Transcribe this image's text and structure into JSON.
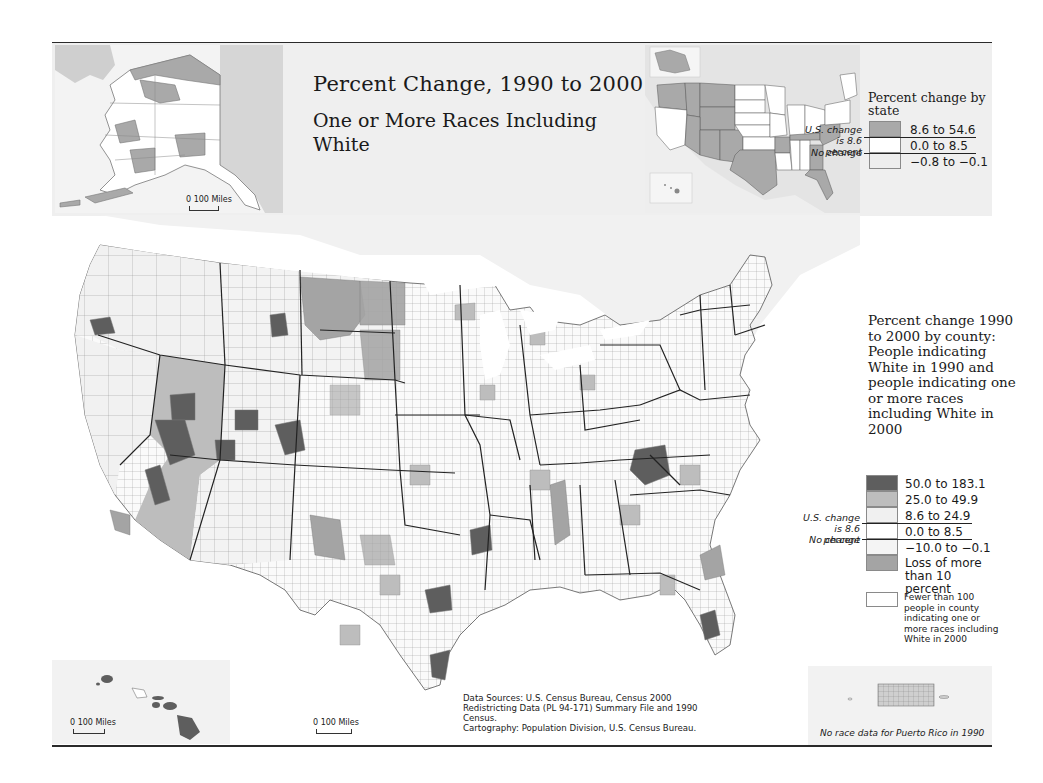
{
  "title": "Percent Change, 1990 to 2000",
  "subtitle": "One or More Races Including White",
  "state_legend": {
    "title": "Percent change by state",
    "us_change_note": "U.S. change is 8.6 percent",
    "no_change_note": "No change",
    "classes": [
      {
        "label": "8.6 to 54.6",
        "color": "#a9a9a9"
      },
      {
        "label": "0.0 to 8.5",
        "color": "#ffffff"
      },
      {
        "label": "−0.8 to −0.1",
        "color": "#eeeeee"
      }
    ]
  },
  "county_legend": {
    "title": "Percent change 1990 to 2000 by county: People indicating White in 1990 and people indicating one or more races including White in 2000",
    "us_change_note": "U.S. change is 8.6 percent",
    "no_change_note": "No change",
    "classes": [
      {
        "label": "50.0 to 183.1",
        "color": "#5e5e5e"
      },
      {
        "label": "25.0 to 49.9",
        "color": "#bdbdbd"
      },
      {
        "label": "8.6 to 24.9",
        "color": "#f0f0f0"
      },
      {
        "label": "0.0 to 8.5",
        "color": "#ffffff"
      },
      {
        "label": "−10.0 to −0.1",
        "color": "#f4f4f4"
      },
      {
        "label": "Loss of more than 10 percent",
        "color": "#a4a4a4"
      }
    ],
    "fewer_note": {
      "label": "Fewer than 100 people in county indicating one or more races including White in 2000",
      "color": "#ffffff"
    }
  },
  "insets": {
    "alaska": {
      "scale_label": "0  100 Miles"
    },
    "hawaii": {
      "scale_label": "0     100 Miles"
    },
    "main_scale": {
      "scale_label": "0     100 Miles"
    },
    "puerto_rico": {
      "note": "No race data for Puerto Rico in 1990"
    }
  },
  "sources": {
    "line1": "Data Sources: U.S. Census Bureau, Census 2000 Redistricting Data (PL 94-171) Summary File and 1990 Census.",
    "line2": "Cartography: Population Division, U.S. Census Bureau."
  },
  "colors": {
    "darkest": "#5e5e5e",
    "medium": "#bdbdbd",
    "loss": "#a4a4a4",
    "light": "#f0f0f0",
    "white": "#ffffff",
    "border": "#7a7a7a",
    "state_border": "#222222",
    "background_land": "#efefef"
  }
}
